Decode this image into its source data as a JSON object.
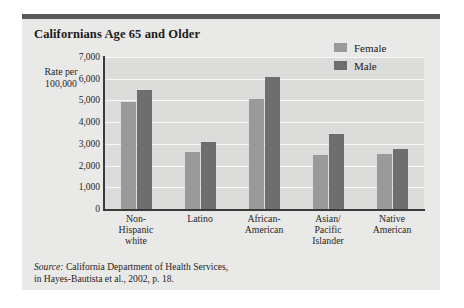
{
  "card": {
    "title": "Californians Age 65 and Older"
  },
  "source": {
    "prefix": "Source:",
    "line1": " California Department of Health Services,",
    "line2": "in Hayes-Bautista et al., 2002, p. 18."
  },
  "colors": {
    "female": "#9a9a9a",
    "male": "#6e6e6e",
    "plot_background": "#dcdcda",
    "card_background": "#e9e9e7",
    "rule": "#595959",
    "axis": "#3a3a3a",
    "gridline": "#f7f7f6"
  },
  "chart_data": {
    "type": "bar",
    "title": "Californians Age 65 and Older",
    "xlabel": "",
    "ylabel": "Rate per 100,000",
    "ylabel_lines": [
      "Rate per",
      "100,000"
    ],
    "ylim": [
      0,
      7000
    ],
    "ytick_values": [
      7000,
      6000,
      5000,
      4000,
      3000,
      2000,
      1000,
      0
    ],
    "ytick_labels": [
      "7,000",
      "6,000",
      "5,000",
      "4,000",
      "3,000",
      "2,000",
      "1,000",
      "0"
    ],
    "grid": true,
    "legend_position": "top-right",
    "categories": [
      "Non-Hispanic white",
      "Latino",
      "African-American",
      "Asian/Pacific Islander",
      "Native American"
    ],
    "category_lines": [
      [
        "Non-",
        "Hispanic",
        "white"
      ],
      [
        "Latino"
      ],
      [
        "African-",
        "American"
      ],
      [
        "Asian/",
        "Pacific",
        "Islander"
      ],
      [
        "Native",
        "American"
      ]
    ],
    "series": [
      {
        "name": "Female",
        "values": [
          4950,
          2620,
          5050,
          2500,
          2520
        ]
      },
      {
        "name": "Male",
        "values": [
          5500,
          3080,
          6100,
          3450,
          2750
        ]
      }
    ]
  }
}
